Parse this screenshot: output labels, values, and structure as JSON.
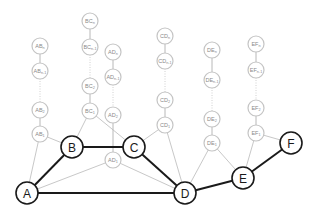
{
  "diagram": {
    "type": "graph",
    "colors": {
      "main_stroke": "#1a1a1a",
      "aux_stroke": "#c4c4c4",
      "aux_text": "#8a8a8a",
      "background": "#ffffff"
    },
    "main_nodes": [
      {
        "id": "A",
        "label": "A",
        "x": 27,
        "y": 193
      },
      {
        "id": "B",
        "label": "B",
        "x": 72,
        "y": 147
      },
      {
        "id": "C",
        "label": "C",
        "x": 134,
        "y": 147
      },
      {
        "id": "D",
        "label": "D",
        "x": 185,
        "y": 193
      },
      {
        "id": "E",
        "label": "E",
        "x": 243,
        "y": 178
      },
      {
        "id": "F",
        "label": "F",
        "x": 291,
        "y": 143
      }
    ],
    "main_edges": [
      [
        "A",
        "B"
      ],
      [
        "B",
        "C"
      ],
      [
        "C",
        "D"
      ],
      [
        "A",
        "D"
      ],
      [
        "D",
        "E"
      ],
      [
        "E",
        "F"
      ]
    ],
    "chains": [
      {
        "id": "AB",
        "from": "A",
        "to": "B",
        "nodes": [
          {
            "base": "AB",
            "sub": "n",
            "x": 40,
            "y": 46
          },
          {
            "base": "AB",
            "sub": "n-1",
            "x": 40,
            "y": 71
          },
          {
            "base": "AB",
            "sub": "2",
            "x": 40,
            "y": 110
          },
          {
            "base": "AB",
            "sub": "1",
            "x": 40,
            "y": 134
          }
        ]
      },
      {
        "id": "BC",
        "from": "B",
        "to": "C",
        "nodes": [
          {
            "base": "BC",
            "sub": "n",
            "x": 90,
            "y": 21
          },
          {
            "base": "BC",
            "sub": "n-1",
            "x": 90,
            "y": 47
          },
          {
            "base": "BC",
            "sub": "2",
            "x": 90,
            "y": 86
          },
          {
            "base": "BC",
            "sub": "1",
            "x": 90,
            "y": 111
          }
        ]
      },
      {
        "id": "AD",
        "from": "A",
        "to": "D",
        "nodes": [
          {
            "base": "AD",
            "sub": "n",
            "x": 113,
            "y": 52
          },
          {
            "base": "AD",
            "sub": "n-1",
            "x": 113,
            "y": 77
          },
          {
            "base": "AD",
            "sub": "2",
            "x": 113,
            "y": 115
          },
          {
            "base": "AD",
            "sub": "1",
            "x": 113,
            "y": 160
          }
        ]
      },
      {
        "id": "CD",
        "from": "C",
        "to": "D",
        "nodes": [
          {
            "base": "CD",
            "sub": "n",
            "x": 165,
            "y": 36
          },
          {
            "base": "CD",
            "sub": "n-1",
            "x": 165,
            "y": 61
          },
          {
            "base": "CD",
            "sub": "2",
            "x": 165,
            "y": 100
          },
          {
            "base": "CD",
            "sub": "1",
            "x": 165,
            "y": 125
          }
        ]
      },
      {
        "id": "DE",
        "from": "D",
        "to": "E",
        "nodes": [
          {
            "base": "DE",
            "sub": "n",
            "x": 212,
            "y": 50
          },
          {
            "base": "DE",
            "sub": "n-1",
            "x": 212,
            "y": 80
          },
          {
            "base": "DE",
            "sub": "2",
            "x": 212,
            "y": 119
          },
          {
            "base": "DE",
            "sub": "1",
            "x": 212,
            "y": 143
          }
        ]
      },
      {
        "id": "EF",
        "from": "E",
        "to": "F",
        "nodes": [
          {
            "base": "EF",
            "sub": "n",
            "x": 256,
            "y": 44
          },
          {
            "base": "EF",
            "sub": "n-1",
            "x": 256,
            "y": 70
          },
          {
            "base": "EF",
            "sub": "2",
            "x": 256,
            "y": 108
          },
          {
            "base": "EF",
            "sub": "1",
            "x": 256,
            "y": 133
          }
        ]
      }
    ]
  }
}
